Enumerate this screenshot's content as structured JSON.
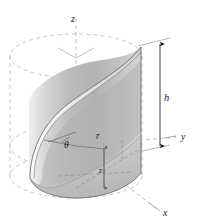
{
  "figure": {
    "background_color": "#ffffff",
    "ink_color": "#1a1a1a",
    "dashed_color": "#b9b9b9",
    "surface_light": "#f2f2f2",
    "surface_mid": "#c9c9c9",
    "surface_dark": "#9a9a9a",
    "floor_fill": "#d8d8d8"
  },
  "labels": {
    "z_axis": "z",
    "y_axis": "y",
    "x_axis": "x",
    "height": "h",
    "radius": "r",
    "theta": "θ",
    "z_coord": "z"
  },
  "geometry": {
    "cylinder": {
      "center_x": 76,
      "top_ellipse_cy": 56,
      "bottom_ellipse_cy": 176,
      "rx": 66,
      "ry": 22,
      "height_px": 120
    },
    "axes": {
      "origin": [
        76,
        146
      ],
      "z_top": [
        76,
        18
      ],
      "y_end": [
        176,
        137
      ],
      "x_end": [
        160,
        212
      ]
    },
    "dimension_line": {
      "x": 160,
      "top_y": 42,
      "bottom_y": 148,
      "label_y": 98
    }
  }
}
